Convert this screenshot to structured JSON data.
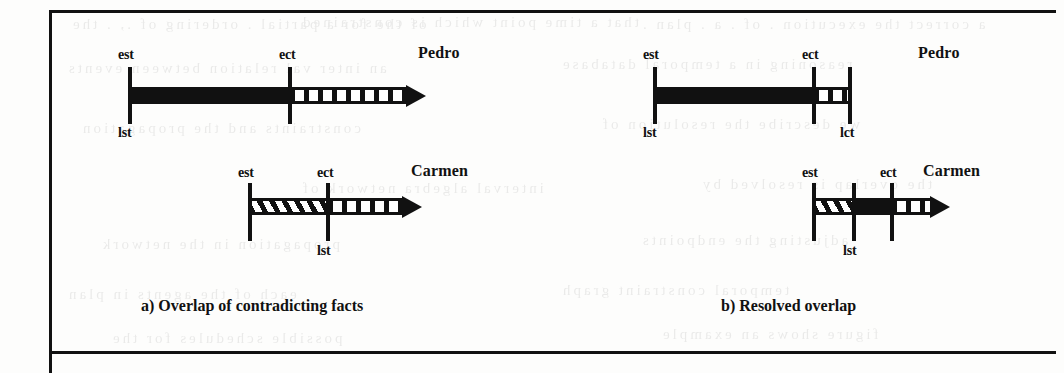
{
  "figure": {
    "panels": [
      {
        "id": "a",
        "caption": "a)  Overlap of contradicting facts",
        "timelines": [
          {
            "id": "pedro",
            "name": "Pedro",
            "ticks": [
              {
                "id": "est",
                "label": "est",
                "position": "above"
              },
              {
                "id": "lst",
                "label": "lst",
                "position": "below"
              },
              {
                "id": "ect",
                "label": "ect",
                "position": "above"
              }
            ],
            "segments": [
              {
                "style": "solid"
              },
              {
                "style": "dashed"
              }
            ],
            "has_arrow": true
          },
          {
            "id": "carmen",
            "name": "Carmen",
            "ticks": [
              {
                "id": "est",
                "label": "est",
                "position": "above"
              },
              {
                "id": "ect",
                "label": "ect",
                "position": "above"
              },
              {
                "id": "lst",
                "label": "lst",
                "position": "below"
              }
            ],
            "segments": [
              {
                "style": "hatch"
              },
              {
                "style": "dashed"
              }
            ],
            "has_arrow": true
          }
        ]
      },
      {
        "id": "b",
        "caption": "b) Resolved overlap",
        "timelines": [
          {
            "id": "pedro",
            "name": "Pedro",
            "ticks": [
              {
                "id": "est",
                "label": "est",
                "position": "above"
              },
              {
                "id": "lst",
                "label": "lst",
                "position": "below"
              },
              {
                "id": "ect",
                "label": "ect",
                "position": "above"
              },
              {
                "id": "lct",
                "label": "lct",
                "position": "below"
              }
            ],
            "segments": [
              {
                "style": "solid"
              },
              {
                "style": "dashed"
              }
            ],
            "has_arrow": false
          },
          {
            "id": "carmen",
            "name": "Carmen",
            "ticks": [
              {
                "id": "est",
                "label": "est",
                "position": "above"
              },
              {
                "id": "lst",
                "label": "lst",
                "position": "below"
              },
              {
                "id": "ect",
                "label": "ect",
                "position": "above"
              }
            ],
            "segments": [
              {
                "style": "hatch"
              },
              {
                "style": "solid"
              },
              {
                "style": "dashed"
              }
            ],
            "has_arrow": true
          }
        ]
      }
    ],
    "colors": {
      "ink": "#111111",
      "paper": "#fdfdfc"
    }
  },
  "ghost_text": [
    {
      "text": "of the for a partial . ordering of ., . the",
      "x": 70,
      "y": 16,
      "size": 15
    },
    {
      "text": "that a  time  point  which  is  constrained",
      "x": 300,
      "y": 14,
      "size": 15
    },
    {
      "text": "a correct the  execution . of . a . plan .",
      "x": 640,
      "y": 16,
      "size": 15
    },
    {
      "text": "an inter val  relation  between  events",
      "x": 66,
      "y": 60,
      "size": 15
    },
    {
      "text": "reasoning  in  a  temporal  database",
      "x": 560,
      "y": 56,
      "size": 15
    },
    {
      "text": "constraints  and  the  propagation",
      "x": 80,
      "y": 120,
      "size": 15
    },
    {
      "text": "we describe  the  resolution  of",
      "x": 600,
      "y": 116,
      "size": 15
    },
    {
      "text": "interval  algebra  network  of",
      "x": 300,
      "y": 180,
      "size": 15
    },
    {
      "text": "the  overlap  is  resolved  by",
      "x": 700,
      "y": 176,
      "size": 15
    },
    {
      "text": "propagation  in  the  network",
      "x": 100,
      "y": 236,
      "size": 15
    },
    {
      "text": "adjusting  the  endpoints",
      "x": 640,
      "y": 232,
      "size": 15
    },
    {
      "text": "each  of  the  agents  in  plan",
      "x": 66,
      "y": 286,
      "size": 15
    },
    {
      "text": "temporal  constraint  graph",
      "x": 560,
      "y": 282,
      "size": 15
    },
    {
      "text": "possible  schedules  for  the",
      "x": 110,
      "y": 330,
      "size": 15
    },
    {
      "text": "figure  shows  an  example",
      "x": 660,
      "y": 326,
      "size": 15
    }
  ]
}
